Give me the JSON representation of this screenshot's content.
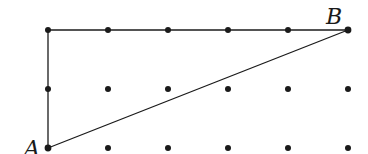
{
  "diagram": {
    "type": "dot-grid-geometry",
    "grid": {
      "columns": 6,
      "rows": 3,
      "origin_x": 48,
      "origin_y": 30,
      "spacing_x": 60,
      "spacing_y": 59
    },
    "points": [
      {
        "label": "A",
        "col": 0,
        "row": 2
      },
      {
        "label": "B",
        "col": 5,
        "row": 0
      }
    ],
    "segments": [
      {
        "from": [
          0,
          2
        ],
        "to": [
          0,
          0
        ]
      },
      {
        "from": [
          0,
          0
        ],
        "to": [
          5,
          0
        ]
      },
      {
        "from": [
          0,
          2
        ],
        "to": [
          5,
          0
        ]
      }
    ],
    "labels": {
      "A": "A",
      "B": "B"
    },
    "colors": {
      "ink": "#1a1a1a",
      "background": "#ffffff"
    }
  }
}
